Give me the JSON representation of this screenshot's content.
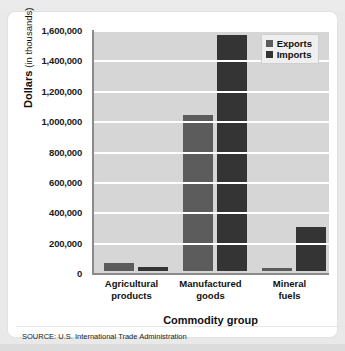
{
  "chart_data": {
    "type": "bar",
    "title": "",
    "xlabel": "Commodity group",
    "ylabel": "Dollars (in thousands)",
    "ylabel_main": "Dollars",
    "ylabel_sub": "(in thousands)",
    "categories": [
      "Agricultural products",
      "Manufactured goods",
      "Mineral fuels"
    ],
    "category_lines": [
      [
        "Agricultural",
        "products"
      ],
      [
        "Manufactured",
        "goods"
      ],
      [
        "Mineral",
        "fuels"
      ]
    ],
    "series": [
      {
        "name": "Exports",
        "color": "#5c5c5c",
        "values": [
          50000,
          1025000,
          20000
        ]
      },
      {
        "name": "Imports",
        "color": "#343434",
        "values": [
          25000,
          1555000,
          290000
        ]
      }
    ],
    "ylim": [
      0,
      1600000
    ],
    "ytick_step": 200000,
    "ytick_labels": [
      "1,600,000",
      "1,400,000",
      "1,200,000",
      "1,000,000",
      "800,000",
      "600,000",
      "400,000",
      "200,000",
      "0"
    ],
    "ytick_values": [
      1600000,
      1400000,
      1200000,
      1000000,
      800000,
      600000,
      400000,
      200000,
      0
    ],
    "grid": true,
    "grid_color": "#ffffff",
    "plot_background": "#d6d6d6",
    "legend_position": "top-right",
    "legend_entries": [
      "Exports",
      "Imports"
    ]
  },
  "source": {
    "text": "SOURCE: U.S. International Trade Administration"
  }
}
